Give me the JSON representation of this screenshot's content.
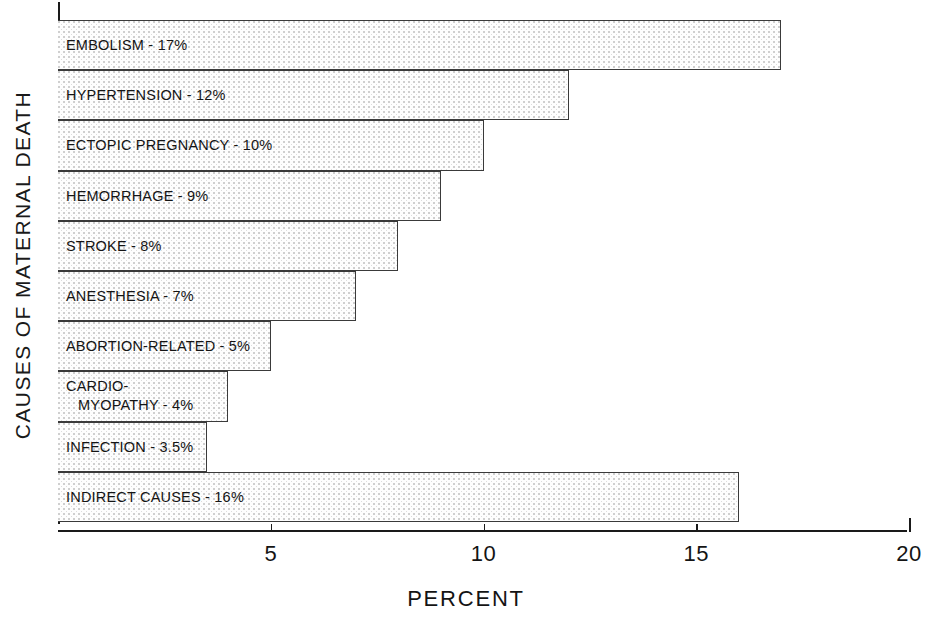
{
  "chart_data": {
    "type": "bar",
    "orientation": "horizontal",
    "title": "",
    "xlabel": "PERCENT",
    "ylabel": "CAUSES OF MATERNAL DEATH",
    "xlim": [
      0,
      20
    ],
    "xticks": [
      5,
      10,
      15,
      20
    ],
    "xtick_labels": [
      "5",
      "10",
      "15",
      "20"
    ],
    "grid": false,
    "legend": null,
    "categories": [
      "EMBOLISM",
      "HYPERTENSION",
      "ECTOPIC PREGNANCY",
      "HEMORRHAGE",
      "STROKE",
      "ANESTHESIA",
      "ABORTION-RELATED",
      "CARDIOMYOPATHY",
      "INFECTION",
      "INDIRECT CAUSES"
    ],
    "values": [
      17,
      12,
      10,
      9,
      8,
      7,
      5,
      4,
      3.5,
      16
    ],
    "bar_labels": [
      "EMBOLISM - 17%",
      "HYPERTENSION - 12%",
      "ECTOPIC PREGNANCY - 10%",
      "HEMORRHAGE - 9%",
      "STROKE -  8%",
      "ANESTHESIA -  7%",
      "ABORTION-RELATED -  5%",
      "MYOPATHY - 4%",
      "INFECTION - 3.5%",
      "INDIRECT CAUSES - 16%"
    ]
  },
  "axes": {
    "y_title": "CAUSES OF MATERNAL DEATH",
    "x_title": "PERCENT",
    "x_tick_labels": [
      "5",
      "10",
      "15",
      "20"
    ]
  },
  "bars": [
    {
      "label": "EMBOLISM - 17%",
      "value": 17
    },
    {
      "label": "HYPERTENSION - 12%",
      "value": 12
    },
    {
      "label": "ECTOPIC PREGNANCY - 10%",
      "value": 10
    },
    {
      "label": "HEMORRHAGE - 9%",
      "value": 9
    },
    {
      "label": "STROKE -  8%",
      "value": 8
    },
    {
      "label": "ANESTHESIA -  7%",
      "value": 7
    },
    {
      "label": "ABORTION-RELATED -  5%",
      "value": 5
    },
    {
      "label_line1": "CARDIO-",
      "label_line2": "MYOPATHY - 4%",
      "value": 4
    },
    {
      "label": "INFECTION - 3.5%",
      "value": 3.5
    },
    {
      "label": "INDIRECT CAUSES - 16%",
      "value": 16
    }
  ],
  "colors": {
    "bar_fill": "#fdfdfd",
    "bar_stipple": "#cfcfcf",
    "bar_border": "#3a3a3a",
    "axis": "#1a1a1a",
    "text": "#141414",
    "background": "#ffffff"
  }
}
